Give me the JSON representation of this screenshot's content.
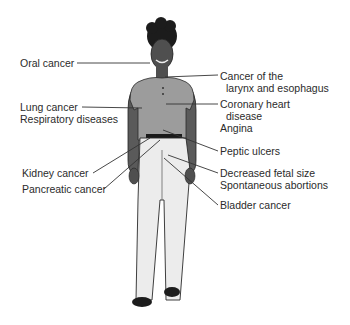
{
  "diagram": {
    "type": "anatomical-annotation",
    "colors": {
      "skin": "#5a5a5a",
      "shirt": "#9c9c9c",
      "pants": "#ececec",
      "outline": "#2a2a2a",
      "text": "#2b2b2b",
      "leader_line": "#333333"
    },
    "labels_left": [
      {
        "id": "oral",
        "lines": [
          "Oral cancer"
        ]
      },
      {
        "id": "lung",
        "lines": [
          "Lung cancer",
          "Respiratory diseases"
        ]
      },
      {
        "id": "kidney",
        "lines": [
          "Kidney cancer"
        ]
      },
      {
        "id": "pancreatic",
        "lines": [
          "Pancreatic cancer"
        ]
      }
    ],
    "labels_right": [
      {
        "id": "larynx",
        "lines": [
          "Cancer of the",
          "larynx and esophagus"
        ]
      },
      {
        "id": "heart",
        "lines": [
          "Coronary heart",
          "disease",
          "Angina"
        ]
      },
      {
        "id": "peptic",
        "lines": [
          "Peptic ulcers"
        ]
      },
      {
        "id": "fetal",
        "lines": [
          "Decreased fetal size",
          "Spontaneous abortions"
        ]
      },
      {
        "id": "bladder",
        "lines": [
          "Bladder cancer"
        ]
      }
    ]
  }
}
